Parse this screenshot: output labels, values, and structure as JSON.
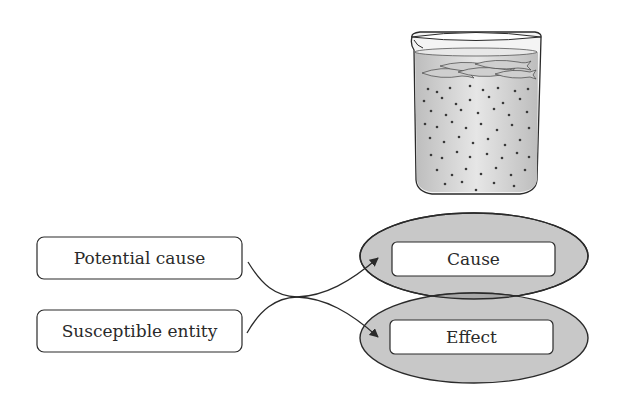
{
  "diagram": {
    "title": "",
    "illustration": {
      "name": "beaker-with-fish",
      "description": "Beaker containing water with fish near the surface and suspended particles"
    },
    "left_nodes": [
      {
        "id": "potential-cause",
        "label": "Potential cause"
      },
      {
        "id": "susceptible-entity",
        "label": "Susceptible entity"
      }
    ],
    "right_nodes": [
      {
        "id": "cause",
        "label": "Cause"
      },
      {
        "id": "effect",
        "label": "Effect"
      }
    ],
    "edges": [
      {
        "from": "potential-cause",
        "to": "effect"
      },
      {
        "from": "susceptible-entity",
        "to": "cause"
      }
    ],
    "colors": {
      "ellipse_fill": "#c8c8c8",
      "ellipse_overlap": "#a8a8a8",
      "stroke": "#2a2a2a",
      "box_fill": "#ffffff",
      "water": "#d9d9d9",
      "particle": "#3a3a3a"
    }
  }
}
